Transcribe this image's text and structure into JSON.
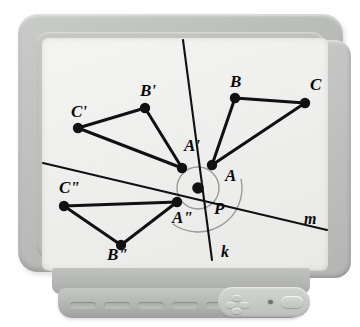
{
  "device": {
    "kind": "crt-monitor",
    "screen_background": "#efefed",
    "frame_color": "#b9bcb8"
  },
  "chart_data": {
    "type": "scatter",
    "title": "",
    "xlabel": "",
    "ylabel": "",
    "subtitle": "",
    "grid": false,
    "legend": "none",
    "xlim": [
      0,
      286
    ],
    "ylim": [
      0,
      232
    ],
    "stroke_color": "#111111",
    "point_color": "#111111",
    "arc_color": "#9a9a9a",
    "lines": [
      {
        "name": "k",
        "label": "k",
        "x1": 141,
        "y1": 2,
        "x2": 170,
        "y2": 222,
        "label_x": 179,
        "label_y": 219
      },
      {
        "name": "m",
        "label": "m",
        "x1": 1,
        "y1": 125,
        "x2": 285,
        "y2": 192,
        "label_x": 262,
        "label_y": 186
      }
    ],
    "arcs": [
      {
        "name": "angle-arc-small",
        "cx": 156,
        "cy": 150,
        "r": 21,
        "start_deg": 0,
        "end_deg": 360
      },
      {
        "name": "angle-arc-large",
        "cx": 156,
        "cy": 150,
        "r": 44,
        "start_deg": -12,
        "end_deg": 125
      }
    ],
    "triangles": [
      {
        "name": "triangle-abc",
        "vertices": [
          {
            "label": "A",
            "x": 170,
            "y": 127,
            "label_x": 183,
            "label_y": 143
          },
          {
            "label": "B",
            "x": 193,
            "y": 60,
            "label_x": 188,
            "label_y": 49
          },
          {
            "label": "C",
            "x": 263,
            "y": 65,
            "label_x": 268,
            "label_y": 52
          }
        ],
        "edges": [
          [
            "A",
            "B"
          ],
          [
            "B",
            "C"
          ],
          [
            "A",
            "C"
          ]
        ]
      },
      {
        "name": "triangle-a-prime",
        "vertices": [
          {
            "label": "A'",
            "x": 140,
            "y": 130,
            "label_x": 142,
            "label_y": 113
          },
          {
            "label": "B'",
            "x": 103,
            "y": 70,
            "label_x": 98,
            "label_y": 58
          },
          {
            "label": "C'",
            "x": 36,
            "y": 90,
            "label_x": 29,
            "label_y": 79
          }
        ],
        "edges": [
          [
            "A'",
            "B'"
          ],
          [
            "B'",
            "C'"
          ],
          [
            "A'",
            "C'"
          ]
        ]
      },
      {
        "name": "triangle-a-double-prime",
        "vertices": [
          {
            "label": "A\"",
            "x": 135,
            "y": 164,
            "label_x": 130,
            "label_y": 185
          },
          {
            "label": "B\"",
            "x": 79,
            "y": 207,
            "label_x": 65,
            "label_y": 222
          },
          {
            "label": "C\"",
            "x": 22,
            "y": 168,
            "label_x": 17,
            "label_y": 155
          }
        ],
        "edges": [
          [
            "A\"",
            "B\""
          ],
          [
            "B\"",
            "C\""
          ],
          [
            "A\"",
            "C\""
          ]
        ]
      }
    ],
    "center_point": {
      "label": "P",
      "x": 156,
      "y": 150,
      "label_x": 172,
      "label_y": 176
    },
    "point_radius": 5.2
  },
  "controls": {
    "dpad_label": "navigation-pad",
    "led_label": "power-led",
    "power_label": "power-button",
    "vent_count": 5
  }
}
